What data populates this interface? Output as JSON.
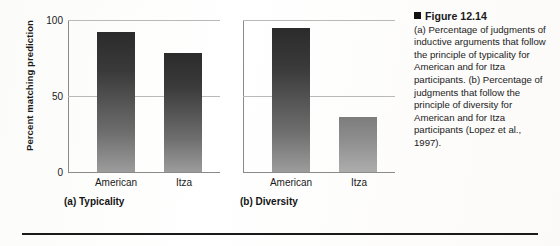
{
  "figure": {
    "caption_marker": "square-bullet",
    "caption_title": "Figure 12.14",
    "caption_text": "(a) Percentage of judgments of inductive arguments that follow the principle of typicality for American and for Itza participants. (b) Percentage of judgments that follow the principle of diversity for American and for Itza participants (Lopez et al., 1997)."
  },
  "chart_data": [
    {
      "type": "bar",
      "title": "(a) Typicality",
      "categories": [
        "American",
        "Itza"
      ],
      "values": [
        92,
        78
      ],
      "xlabel": "",
      "ylabel": "Percent matching prediction",
      "ylim": [
        0,
        100
      ],
      "yticks": [
        "0",
        "50",
        "100"
      ],
      "grid": true,
      "legend": "none"
    },
    {
      "type": "bar",
      "title": "(b) Diversity",
      "categories": [
        "American",
        "Itza"
      ],
      "values": [
        95,
        36
      ],
      "xlabel": "",
      "ylabel": "",
      "ylim": [
        0,
        100
      ],
      "yticks": [],
      "grid": true,
      "legend": "none"
    }
  ],
  "panel_a": {
    "y_axis_title": "Percent matching prediction",
    "tick_100": "100",
    "tick_50": "50",
    "tick_0": "0",
    "cat_1": "American",
    "cat_2": "Itza",
    "subcaption": "(a) Typicality"
  },
  "panel_b": {
    "cat_1": "American",
    "cat_2": "Itza",
    "subcaption": "(b) Diversity"
  }
}
